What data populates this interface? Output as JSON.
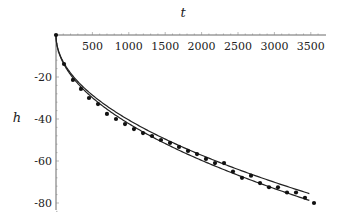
{
  "chart_data": {
    "type": "line",
    "title": "",
    "xlabel": "t",
    "ylabel": "h",
    "xlim": [
      0,
      3700
    ],
    "ylim": [
      -84,
      0
    ],
    "grid": false,
    "legend": null,
    "x_ticks": [
      500,
      1000,
      1500,
      2000,
      2500,
      3000,
      3500
    ],
    "x_tick_labels": [
      "500",
      "1000",
      "1500",
      "2000",
      "2500",
      "3000",
      "3500"
    ],
    "y_ticks": [
      -20,
      -40,
      -60,
      -80
    ],
    "y_tick_labels": [
      "-20",
      "-40",
      "-60",
      "-80"
    ],
    "series": [
      {
        "name": "measured",
        "kind": "scatter",
        "x": [
          0,
          110,
          233,
          343,
          453,
          577,
          700,
          824,
          948,
          1071,
          1195,
          1319,
          1442,
          1566,
          1690,
          1813,
          1937,
          2060,
          2184,
          2308,
          2431,
          2555,
          2679,
          2802,
          2926,
          3049,
          3173,
          3297,
          3420,
          3544
        ],
        "y": [
          0,
          -13.8,
          -21.4,
          -25.7,
          -30.0,
          -32.9,
          -37.6,
          -40.0,
          -42.4,
          -44.8,
          -46.7,
          -48.1,
          -50.0,
          -51.4,
          -53.3,
          -55.2,
          -56.7,
          -59.0,
          -61.0,
          -61.0,
          -65.0,
          -68.0,
          -67.0,
          -70.5,
          -72.5,
          -72.5,
          -75.0,
          -75.0,
          -77.5,
          -80.0
        ]
      },
      {
        "name": "model-upper",
        "kind": "line",
        "formula": "h = -1.28*sqrt(t)",
        "coef": -1.28,
        "t_max": 3480
      },
      {
        "name": "model-lower",
        "kind": "line",
        "formula": "h = -1.335*sqrt(t)",
        "coef": -1.335,
        "t_max": 3480
      }
    ]
  },
  "layout": {
    "origin_px": [
      56,
      35
    ],
    "x_px_per_unit": 0.0728,
    "y_px_per_unit": 2.1,
    "x_axis_end_px": 326,
    "y_axis_end_px": 210
  }
}
